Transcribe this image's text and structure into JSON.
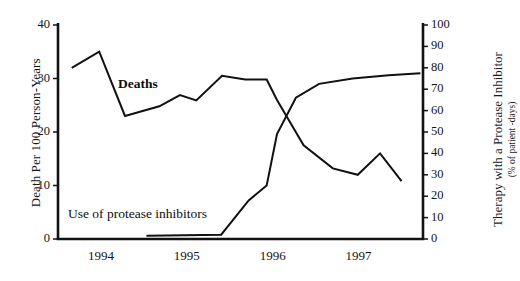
{
  "chart_data": {
    "type": "line",
    "title": "",
    "xlabel": "",
    "ylabel": "Death Per 100 Person-Years",
    "y2label": "Therapy with a Protease Inhibitor",
    "y2label_sub": "(% of patient -days)",
    "xlim": [
      1993.5,
      1997.75
    ],
    "ylim": [
      0,
      40
    ],
    "y2lim": [
      0,
      100
    ],
    "grid": false,
    "legend": "inline-annotations",
    "x_tick_labels": [
      "1994",
      "1995",
      "1996",
      "1997"
    ],
    "x_tick_values": [
      1994,
      1995,
      1996,
      1997
    ],
    "y_tick_labels": [
      "0",
      "10",
      "20",
      "30",
      "40"
    ],
    "y_tick_values": [
      0,
      10,
      20,
      30,
      40
    ],
    "y2_tick_labels": [
      "0",
      "10",
      "20",
      "30",
      "40",
      "50",
      "60",
      "70",
      "80",
      "90",
      "100"
    ],
    "y2_tick_values": [
      0,
      10,
      20,
      30,
      40,
      50,
      60,
      70,
      80,
      90,
      100
    ],
    "series": [
      {
        "name": "Deaths",
        "axis": "left",
        "color": "#111111",
        "label_text": "Deaths",
        "x": [
          1993.66,
          1993.98,
          1994.28,
          1994.68,
          1994.92,
          1995.11,
          1995.41,
          1995.68,
          1995.93,
          1996.05,
          1996.36,
          1996.7,
          1996.99,
          1997.25,
          1997.5
        ],
        "values": [
          32.0,
          35.0,
          23.0,
          24.8,
          26.9,
          25.9,
          30.5,
          29.8,
          29.8,
          26.0,
          17.5,
          13.2,
          12.0,
          16.0,
          10.8
        ]
      },
      {
        "name": "Use of protease inhibitors",
        "axis": "right",
        "color": "#111111",
        "label_text": "Use of protease inhibitors",
        "x": [
          1994.53,
          1995.4,
          1995.72,
          1995.93,
          1996.05,
          1996.27,
          1996.54,
          1996.93,
          1997.35,
          1997.72
        ],
        "values": [
          1.5,
          2.0,
          18.0,
          25.0,
          49.0,
          66.0,
          72.5,
          75.0,
          76.5,
          77.5
        ]
      }
    ],
    "annotations": [
      {
        "name": "deaths-label",
        "text": "Deaths",
        "x_px": 118,
        "y_px": 76
      },
      {
        "name": "protease-label",
        "text": "Use of protease inhibitors",
        "x_px": 68,
        "y_px": 206
      }
    ],
    "axes_style": {
      "left_axis_x_px": 58,
      "right_axis_x_px": 423,
      "top_y_px": 25,
      "bottom_y_px": 239,
      "axis_color": "#121212",
      "line_color": "#111111"
    }
  }
}
